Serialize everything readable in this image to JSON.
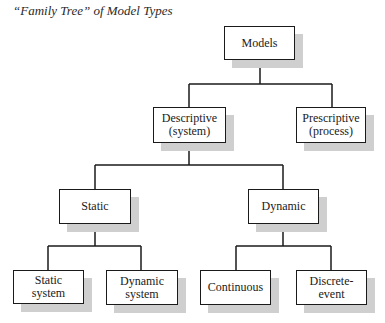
{
  "title": "“Family Tree” of Model Types",
  "tree": {
    "root": {
      "label": "Models"
    },
    "level1": [
      {
        "label": "Descriptive\n(system)"
      },
      {
        "label": "Prescriptive\n(process)"
      }
    ],
    "level2": [
      {
        "label": "Static"
      },
      {
        "label": "Dynamic"
      }
    ],
    "level3": [
      {
        "label": "Static\nsystem"
      },
      {
        "label": "Dynamic\nsystem"
      },
      {
        "label": "Continuous"
      },
      {
        "label": "Discrete-\nevent"
      }
    ]
  },
  "colors": {
    "line": "#1a1a1a",
    "shadow": "#cfcfcf",
    "box_fill": "#ffffff"
  }
}
